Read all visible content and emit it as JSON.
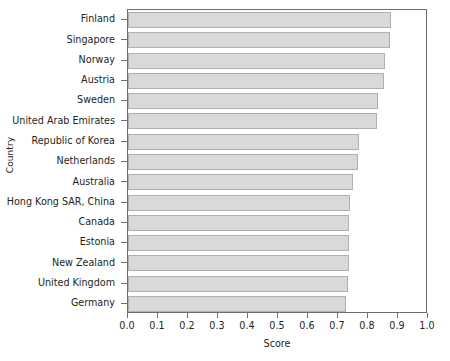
{
  "chart_data": {
    "type": "bar",
    "orientation": "horizontal",
    "title": "",
    "xlabel": "Score",
    "ylabel": "Country",
    "xlim": [
      0.0,
      1.0
    ],
    "xticks": [
      "0.0",
      "0.1",
      "0.2",
      "0.3",
      "0.4",
      "0.5",
      "0.6",
      "0.7",
      "0.8",
      "0.9",
      "1.0"
    ],
    "xtick_values": [
      0.0,
      0.1,
      0.2,
      0.3,
      0.4,
      0.5,
      0.6,
      0.7,
      0.8,
      0.9,
      1.0
    ],
    "grid": false,
    "legend": "none",
    "categories": [
      "Finland",
      "Singapore",
      "Norway",
      "Austria",
      "Sweden",
      "United Arab Emirates",
      "Republic of Korea",
      "Netherlands",
      "Australia",
      "Hong Kong SAR, China",
      "Canada",
      "Estonia",
      "New Zealand",
      "United Kingdom",
      "Germany"
    ],
    "values": [
      0.875,
      0.873,
      0.857,
      0.852,
      0.833,
      0.83,
      0.77,
      0.767,
      0.75,
      0.74,
      0.737,
      0.736,
      0.735,
      0.733,
      0.725
    ],
    "bar_color": "#d9d9d9",
    "bar_edge_color": "#b0b0b0",
    "axis_color": "#6d6e71",
    "text_color": "#231f20"
  }
}
